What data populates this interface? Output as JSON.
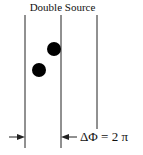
{
  "diagram": {
    "title": "Double Source",
    "phase_label": "ΔΦ = 2 π",
    "colors": {
      "line": "#222222",
      "dot": "#000000"
    },
    "wavefronts": [
      {
        "x": 25,
        "y1": 15,
        "y2": 148
      },
      {
        "x": 61,
        "y1": 15,
        "y2": 148
      },
      {
        "x": 97,
        "y1": 15,
        "y2": 129
      }
    ],
    "sources": [
      {
        "cx": 54,
        "cy": 49,
        "r": 7
      },
      {
        "cx": 39,
        "cy": 70,
        "r": 7
      }
    ]
  }
}
